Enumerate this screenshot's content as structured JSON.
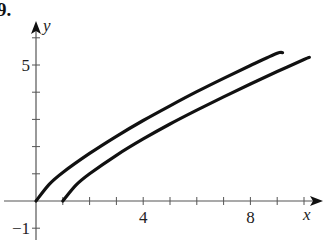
{
  "problem_label": "9.",
  "chart_data": {
    "type": "line",
    "title": "",
    "xlabel": "x",
    "ylabel": "y",
    "xlim": [
      0,
      10.8
    ],
    "ylim": [
      -1.2,
      6.5
    ],
    "x_ticks": [
      1,
      2,
      3,
      4,
      5,
      6,
      7,
      8,
      9,
      10
    ],
    "x_tick_labels": [
      {
        "value": 4,
        "label": "4"
      },
      {
        "value": 8,
        "label": "8"
      }
    ],
    "y_ticks": [
      -1,
      1,
      2,
      3,
      4,
      5,
      6
    ],
    "y_tick_labels": [
      {
        "value": 5,
        "label": "5"
      },
      {
        "value": -1,
        "label": "−1"
      }
    ],
    "grid": false,
    "legend": null,
    "series": [
      {
        "name": "upper curve",
        "x": [
          0,
          0.5,
          1,
          2,
          3,
          4,
          5,
          6,
          7,
          8,
          9,
          9.2
        ],
        "y": [
          0,
          0.62,
          1.05,
          1.75,
          2.38,
          2.96,
          3.5,
          4.02,
          4.51,
          4.98,
          5.43,
          5.45
        ],
        "color": "#111111"
      },
      {
        "name": "lower curve",
        "x": [
          1,
          1.5,
          2,
          3,
          4,
          5,
          6,
          7,
          8,
          9,
          10,
          10.2
        ],
        "y": [
          0,
          0.59,
          1.0,
          1.68,
          2.28,
          2.83,
          3.34,
          3.83,
          4.3,
          4.76,
          5.2,
          5.28
        ],
        "color": "#111111"
      }
    ]
  }
}
